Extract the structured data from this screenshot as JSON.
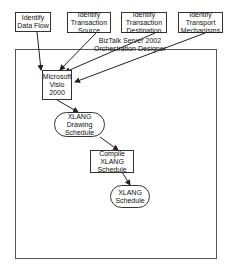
{
  "diagram": {
    "container_title_line1": "BizTalk Server 2002",
    "container_title_line2": "Orchestration Designer",
    "top_boxes": [
      {
        "label": "Identify Data Flow"
      },
      {
        "label": "Identify Transaction Source"
      },
      {
        "label": "Identify Transaction Destination"
      },
      {
        "label": "Identify Transport Mechanisms"
      }
    ],
    "nodes": {
      "visio": "Microsoft Visio 2000",
      "drawing": "XLANG Drawing Schedule",
      "compile": "Compile XLANG Schedule",
      "schedule": "XLANG Schedule"
    },
    "colors": {
      "line": "#222222",
      "border": "#333333",
      "background": "#ffffff"
    }
  }
}
